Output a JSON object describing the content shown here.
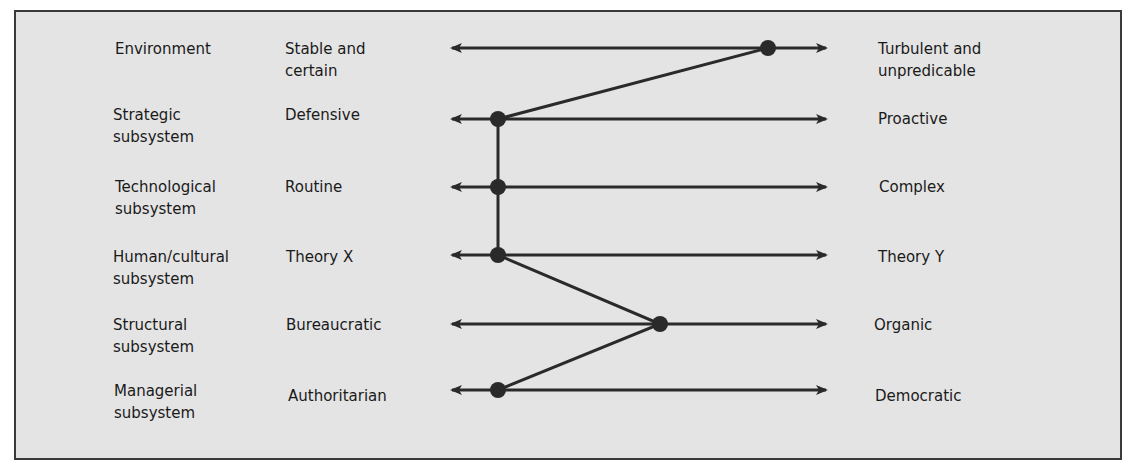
{
  "rows": [
    {
      "dimension": "Environment",
      "left_pole": "Stable and\ncertain",
      "right_pole": "Turbulent and\nunpredicable",
      "y": 48,
      "dot_x": 768
    },
    {
      "dimension": "Strategic\nsubsystem",
      "left_pole": "Defensive",
      "right_pole": "Proactive",
      "y": 119,
      "dot_x": 498
    },
    {
      "dimension": "Technological\nsubsystem",
      "left_pole": "Routine",
      "right_pole": "Complex",
      "y": 187,
      "dot_x": 498
    },
    {
      "dimension": "Human/cultural\nsubsystem",
      "left_pole": "Theory X",
      "right_pole": "Theory Y",
      "y": 255,
      "dot_x": 498
    },
    {
      "dimension": "Structural\nsubsystem",
      "left_pole": "Bureaucratic",
      "right_pole": "Organic",
      "y": 324,
      "dot_x": 660
    },
    {
      "dimension": "Managerial\nsubsystem",
      "left_pole": "Authoritarian",
      "right_pole": "Democratic",
      "y": 390,
      "dot_x": 498
    }
  ],
  "colors": {
    "background": "#e4e4e4",
    "ink": "#2a2a2a",
    "border": "#3a3a3a"
  }
}
